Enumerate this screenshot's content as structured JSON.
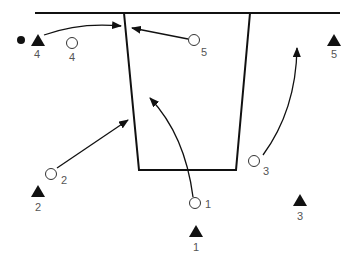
{
  "diagram": {
    "type": "basketball-half-court-play",
    "colors": {
      "line": "#111111",
      "label": "#555555",
      "background": "#ffffff"
    },
    "offense": [
      {
        "id": "O1",
        "label": "1",
        "x": 195,
        "y": 203,
        "lx": 205,
        "ly": 207
      },
      {
        "id": "O2",
        "label": "2",
        "x": 51,
        "y": 174,
        "lx": 61,
        "ly": 184
      },
      {
        "id": "O3",
        "label": "3",
        "x": 254,
        "y": 161,
        "lx": 262,
        "ly": 174
      },
      {
        "id": "O4",
        "label": "4",
        "x": 72,
        "y": 43,
        "lx": 68,
        "ly": 60
      },
      {
        "id": "O5",
        "label": "5",
        "x": 194,
        "y": 40,
        "lx": 200,
        "ly": 55
      }
    ],
    "defense": [
      {
        "id": "X1",
        "label": "1",
        "x": 196,
        "y": 232,
        "lx": 193,
        "ly": 251
      },
      {
        "id": "X2",
        "label": "2",
        "x": 38,
        "y": 191,
        "lx": 35,
        "ly": 210
      },
      {
        "id": "X3",
        "label": "3",
        "x": 300,
        "y": 200,
        "lx": 297,
        "ly": 219
      },
      {
        "id": "X4",
        "label": "4",
        "x": 38,
        "y": 40,
        "lx": 34,
        "ly": 57
      },
      {
        "id": "X5",
        "label": "5",
        "x": 334,
        "y": 40,
        "lx": 331,
        "ly": 57
      }
    ],
    "ball": {
      "holder": "X4",
      "x": 21,
      "y": 40
    }
  }
}
